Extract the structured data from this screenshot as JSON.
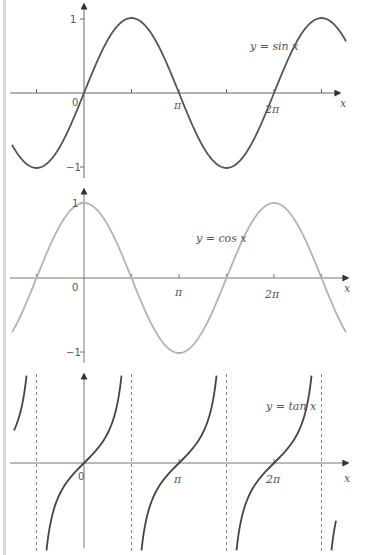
{
  "chart_data": [
    {
      "type": "line",
      "title": "y = sin x",
      "function": "sin",
      "xlabel": "x",
      "ylabel": "",
      "x_ticks": [
        "0",
        "π",
        "2π"
      ],
      "y_ticks": [
        "1",
        "-1"
      ],
      "xlim": [
        -1.7,
        7.0
      ],
      "ylim": [
        -1,
        1
      ],
      "color": "#555555",
      "grid": false,
      "x": [
        -1.571,
        0,
        1.571,
        3.142,
        4.712,
        6.283,
        7.854
      ],
      "values": [
        -1,
        0,
        1,
        0,
        -1,
        0,
        1
      ]
    },
    {
      "type": "line",
      "title": "y = cos x",
      "function": "cos",
      "xlabel": "x",
      "ylabel": "",
      "x_ticks": [
        "0",
        "π",
        "2π"
      ],
      "y_ticks": [
        "1",
        "-1"
      ],
      "xlim": [
        -1.7,
        7.0
      ],
      "ylim": [
        -1,
        1
      ],
      "color": "#b0b0b0",
      "grid": false,
      "x": [
        -1.571,
        0,
        1.571,
        3.142,
        4.712,
        6.283,
        7.854
      ],
      "values": [
        0,
        1,
        0,
        -1,
        0,
        1,
        0
      ]
    },
    {
      "type": "line",
      "title": "y = tan x",
      "function": "tan",
      "xlabel": "x",
      "ylabel": "",
      "x_ticks": [
        "0",
        "π",
        "2π"
      ],
      "asymptotes": [
        "-π/2",
        "π/2",
        "3π/2",
        "5π/2"
      ],
      "xlim": [
        -1.7,
        7.0
      ],
      "color": "#444444",
      "grid": false,
      "x": [
        0,
        3.142,
        6.283
      ],
      "values": [
        0,
        0,
        0
      ]
    }
  ],
  "labels": {
    "sin": {
      "eq": "y = sin x",
      "zero": "0",
      "one": "1",
      "neg_one": "−1",
      "pi": "π",
      "two_pi": "2π",
      "x": "x"
    },
    "cos": {
      "eq": "y = cos x",
      "zero": "0",
      "one": "1",
      "neg_one": "−1",
      "pi": "π",
      "two_pi": "2π",
      "x": "x"
    },
    "tan": {
      "eq": "y = tan x",
      "zero": "0",
      "pi": "π",
      "two_pi": "2π",
      "x": "x"
    }
  }
}
